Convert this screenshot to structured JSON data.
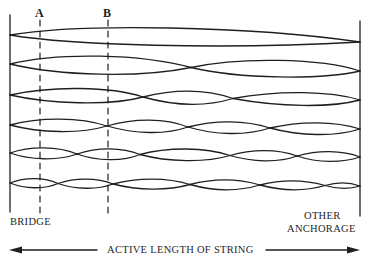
{
  "figure": {
    "markers": {
      "a": "A",
      "b": "B"
    },
    "labels": {
      "bridge": "BRIDGE",
      "other_anchorage_line1": "OTHER",
      "other_anchorage_line2": "ANCHORAGE",
      "active_length": "ACTIVE LENGTH OF STRING"
    },
    "modes": [
      {
        "harmonic": 1,
        "loops": 1
      },
      {
        "harmonic": 2,
        "loops": 2
      },
      {
        "harmonic": 3,
        "loops": 3
      },
      {
        "harmonic": 4,
        "loops": 4
      },
      {
        "harmonic": 5,
        "loops": 5
      },
      {
        "harmonic": 6,
        "loops": 6
      }
    ],
    "colors": {
      "ink": "#1f1f1f",
      "background": "#ffffff"
    }
  }
}
